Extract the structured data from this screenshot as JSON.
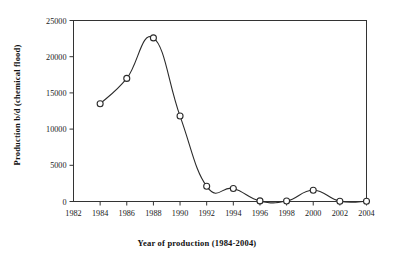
{
  "chart_data": {
    "type": "line",
    "title": "",
    "xlabel": "Year of production (1984-2004)",
    "ylabel": "Production b/d (chemical flood)",
    "x": [
      1984,
      1986,
      1988,
      1990,
      1992,
      1994,
      1996,
      1998,
      2000,
      2002,
      2004
    ],
    "values": [
      13500,
      17000,
      22600,
      11800,
      2100,
      1800,
      80,
      60,
      1550,
      40,
      30
    ],
    "series": [
      {
        "name": "Production b/d (chemical flood)",
        "values": [
          13500,
          17000,
          22600,
          11800,
          2100,
          1800,
          80,
          60,
          1550,
          40,
          30
        ]
      }
    ],
    "xlim": [
      1982,
      2004
    ],
    "ylim": [
      0,
      25000
    ],
    "xticks": [
      1982,
      1984,
      1986,
      1988,
      1990,
      1992,
      1994,
      1996,
      1998,
      2000,
      2002,
      2004
    ],
    "yticks": [
      0,
      5000,
      10000,
      15000,
      20000,
      25000
    ],
    "xtick_labels": [
      "1982",
      "1984",
      "1986",
      "1988",
      "1990",
      "1992",
      "1994",
      "1996",
      "1998",
      "2000",
      "2002",
      "2004"
    ],
    "ytick_labels": [
      "0",
      "5000",
      "10000",
      "15000",
      "20000",
      "25000"
    ],
    "grid": false,
    "legend": false,
    "legend_position": "none",
    "marker": "open-circle",
    "line_color": "#2b2b2b",
    "marker_fill": "#ffffff",
    "background": "#ffffff"
  },
  "axes": {
    "x_title": "Year of production (1984-2004)",
    "y_title": "Production b/d (chemical flood)"
  }
}
